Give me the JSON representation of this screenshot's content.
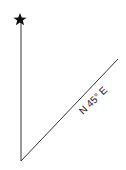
{
  "diagram": {
    "type": "bearing",
    "north_marker": "star",
    "bearing_label": "N 45° E",
    "colors": {
      "line": "#333333",
      "marker": "#111111",
      "text": "#222222"
    }
  }
}
